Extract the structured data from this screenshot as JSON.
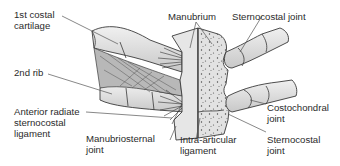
{
  "diagram": {
    "labels": {
      "first_costal_cartilage": {
        "line1": "1st costal",
        "line2": "cartilage"
      },
      "second_rib": {
        "line1": "2nd rib"
      },
      "anterior_radiate": {
        "line1": "Anterior radiate",
        "line2": "sternocostal",
        "line3": "ligament"
      },
      "manubrium": {
        "line1": "Manubrium"
      },
      "sternocostal_joint_top": {
        "line1": "Sternocostal joint"
      },
      "manubriosternal_joint": {
        "line1": "Manubriosternal",
        "line2": "joint"
      },
      "intra_articular": {
        "line1": "Intra-articular",
        "line2": "ligament"
      },
      "costochondral_joint": {
        "line1": "Costochondral",
        "line2": "joint"
      },
      "sternocostal_joint_bottom": {
        "line1": "Sternocostal",
        "line2": "joint"
      }
    },
    "colors": {
      "bone_fill": "#e4e4e4",
      "bone_shade": "#c9c9c9",
      "outline": "#3a3a3a",
      "leader_line": "#555555",
      "text": "#2b2b2b"
    }
  }
}
